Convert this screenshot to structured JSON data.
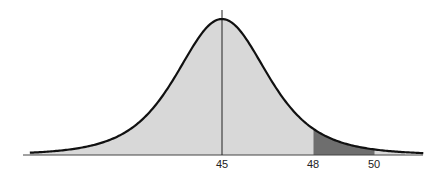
{
  "chart_data": {
    "type": "area",
    "title": "",
    "xlabel": "",
    "ylabel": "",
    "distribution": "bell-shaped (normal-like) density curve",
    "mean": 45,
    "xlim": [
      38.7,
      51.6
    ],
    "tick_labels": [
      "45",
      "48",
      "50"
    ],
    "ticks": [
      45,
      48,
      50
    ],
    "mean_line": {
      "x": 45,
      "visible": true
    },
    "shaded_regions": [
      {
        "from": 38.7,
        "to": 48,
        "color": "#d8d8d8",
        "label": ""
      },
      {
        "from": 48,
        "to": 50,
        "color": "#6e6e6e",
        "label": ""
      },
      {
        "from": 50,
        "to": 51,
        "color": "#d8d8d8",
        "label": ""
      }
    ],
    "grid": false,
    "legend": null
  },
  "colors": {
    "curve": "#111111",
    "axis": "#444444",
    "light_fill": "#d8d8d8",
    "dark_fill": "#6e6e6e"
  }
}
